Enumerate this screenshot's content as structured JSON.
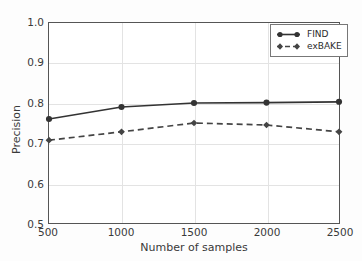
{
  "chart_data": {
    "type": "line",
    "title": "",
    "xlabel": "Number of samples",
    "ylabel": "Precision",
    "x": [
      500,
      1000,
      1500,
      2000,
      2500
    ],
    "xticklabels": [
      "500",
      "1000",
      "1500",
      "2000",
      "2500"
    ],
    "yticklabels": [
      "0.5",
      "0.6",
      "0.7",
      "0.8",
      "0.9",
      "1.0"
    ],
    "yticks": [
      0.5,
      0.6,
      0.7,
      0.8,
      0.9,
      1.0
    ],
    "xlim": [
      500,
      2500
    ],
    "ylim": [
      0.5,
      1.0
    ],
    "grid": true,
    "legend_position": "upper right",
    "series": [
      {
        "name": "FIND",
        "values": [
          0.76,
          0.79,
          0.8,
          0.801,
          0.803
        ],
        "linestyle": "solid",
        "marker": "circle",
        "color": "#333333"
      },
      {
        "name": "exBAKE",
        "values": [
          0.707,
          0.728,
          0.75,
          0.745,
          0.728
        ],
        "linestyle": "dashed",
        "marker": "diamond",
        "color": "#444444"
      }
    ]
  },
  "legend": {
    "entries": [
      {
        "label": "FIND"
      },
      {
        "label": "exBAKE"
      }
    ]
  },
  "axes": {
    "ytick_0": "0.5",
    "ytick_1": "0.6",
    "ytick_2": "0.7",
    "ytick_3": "0.8",
    "ytick_4": "0.9",
    "ytick_5": "1.0",
    "xtick_0": "500",
    "xtick_1": "1000",
    "xtick_2": "1500",
    "xtick_3": "2000",
    "xtick_4": "2500",
    "xlabel": "Number of samples",
    "ylabel": "Precision"
  }
}
